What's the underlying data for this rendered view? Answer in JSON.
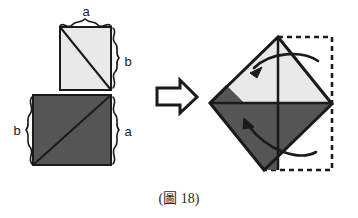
{
  "figure": {
    "caption": "(圖 18)",
    "caption_prefix": "(",
    "caption_suffix": ")",
    "caption_label": "圖",
    "caption_number": "18"
  },
  "colors": {
    "light_fill": "#e9e9e9",
    "dark_fill": "#555555",
    "stroke": "#1a1a1a",
    "background": "#ffffff",
    "dashed_stroke": "#1a1a1a",
    "label_color": "#1a1a1a"
  },
  "left_figure": {
    "name": "two-squares-L-shape",
    "labels": [
      {
        "id": "top-a",
        "text": "a",
        "x": 86,
        "y": 16
      },
      {
        "id": "right-b",
        "text": "b",
        "x": 133,
        "y": 62
      },
      {
        "id": "left-b",
        "text": "b",
        "x": 22,
        "y": 130
      },
      {
        "id": "right-a",
        "text": "a",
        "x": 133,
        "y": 134
      }
    ],
    "light_square": {
      "x": 60,
      "y": 27,
      "w": 51,
      "h": 63
    },
    "dark_square": {
      "x": 33,
      "y": 95,
      "w": 78,
      "h": 70
    },
    "diagonals": [
      {
        "id": "light-diagonal",
        "x1": 60,
        "y1": 27,
        "x2": 111,
        "y2": 90
      },
      {
        "id": "dark-diagonal",
        "x1": 111,
        "y1": 95,
        "x2": 33,
        "y2": 165
      }
    ]
  },
  "arrow": {
    "name": "transform-arrow",
    "direction": "right",
    "x": 156,
    "y": 80,
    "w": 42,
    "h": 33
  },
  "right_figure": {
    "name": "folded-square-diamond",
    "diamond": {
      "top": {
        "x": 278,
        "y": 37
      },
      "right": {
        "x": 332,
        "y": 104
      },
      "bottom": {
        "x": 264,
        "y": 170
      },
      "left": {
        "x": 210,
        "y": 103
      }
    },
    "dashed_square": {
      "x": 278,
      "y": 37,
      "w": 54,
      "h": 133
    },
    "fold_arrows": [
      {
        "id": "upper-fold-arrow",
        "label": "fold-down-top-flap"
      },
      {
        "id": "lower-fold-arrow",
        "label": "fold-up-bottom-flap"
      }
    ]
  }
}
